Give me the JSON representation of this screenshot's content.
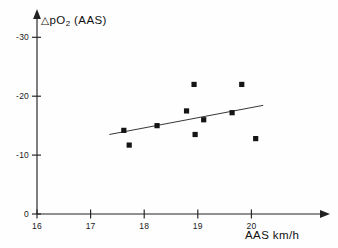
{
  "chart_data": {
    "type": "scatter",
    "title": "",
    "xlabel": "AAS km/h",
    "ylabel": "△pO2 (AAS)",
    "ylabel_parts": {
      "delta": "△",
      "p": "p",
      "o": "O",
      "sub": "2",
      "unit": "(AAS)"
    },
    "xlim": [
      16,
      20.35
    ],
    "ylim": [
      0,
      -32
    ],
    "grid": false,
    "legend": null,
    "xticks": [
      16,
      17,
      18,
      19,
      20
    ],
    "xtick_labels": [
      "16",
      "17",
      "18",
      "19",
      "20"
    ],
    "yticks": [
      0,
      -10,
      -20,
      -30
    ],
    "ytick_labels": [
      "0",
      "-10",
      "-20",
      "-30"
    ],
    "points": [
      {
        "x": 17.62,
        "y": -14.2
      },
      {
        "x": 17.72,
        "y": -11.7
      },
      {
        "x": 18.24,
        "y": -15.0
      },
      {
        "x": 18.79,
        "y": -17.5
      },
      {
        "x": 18.93,
        "y": -22.0
      },
      {
        "x": 18.95,
        "y": -13.5
      },
      {
        "x": 19.11,
        "y": -16.0
      },
      {
        "x": 19.64,
        "y": -17.2
      },
      {
        "x": 19.82,
        "y": -22.0
      },
      {
        "x": 20.08,
        "y": -12.8
      }
    ],
    "trend_line": {
      "label": "regression line",
      "x_start": 17.35,
      "y_start": -13.5,
      "x_end": 20.22,
      "y_end": -18.45
    },
    "colors": {
      "marker": "#141414",
      "axis": "#222222",
      "line": "#2b2b2b",
      "background": "#fefefe"
    }
  }
}
